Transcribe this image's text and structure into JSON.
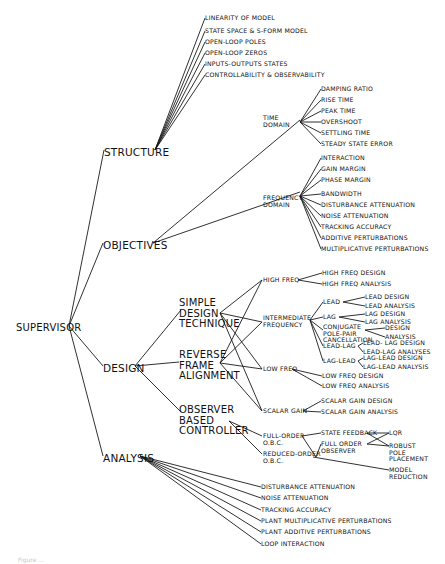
{
  "diagram": {
    "root": {
      "id": "supervisor",
      "label": "SUPERVISOR",
      "x": 16,
      "y": 323,
      "size": "lg"
    },
    "colors": {
      "line": "#1a1a1a",
      "text": "#111111",
      "background": "#ffffff"
    },
    "nodes": [
      {
        "id": "structure",
        "label": "STRUCTURE",
        "x": 104,
        "y": 147,
        "size": "xl"
      },
      {
        "id": "objectives",
        "label": "OBJECTIVES",
        "x": 103,
        "y": 240,
        "size": "xl"
      },
      {
        "id": "design",
        "label": "DESIGN",
        "x": 103,
        "y": 363,
        "size": "xl"
      },
      {
        "id": "analysis",
        "label": "ANALYSIS",
        "x": 103,
        "y": 453,
        "size": "xl"
      },
      {
        "id": "s1",
        "label": "LINEARITY OF MODEL",
        "x": 205,
        "y": 15,
        "size": "sm"
      },
      {
        "id": "s2",
        "label": "STATE SPACE & S-FORM MODEL",
        "x": 205,
        "y": 28,
        "size": "sm"
      },
      {
        "id": "s3",
        "label": "OPEN-LOOP POLES",
        "x": 205,
        "y": 39,
        "size": "sm"
      },
      {
        "id": "s4",
        "label": "OPEN-LOOP ZEROS",
        "x": 205,
        "y": 50,
        "size": "sm"
      },
      {
        "id": "s5",
        "label": "INPUTS-OUTPUTS STATES",
        "x": 205,
        "y": 61,
        "size": "sm"
      },
      {
        "id": "s6",
        "label": "CONTROLLABILITY & OBSERVABILITY",
        "x": 205,
        "y": 72,
        "size": "sm"
      },
      {
        "id": "time",
        "label": "TIME\nDOMAIN",
        "x": 263,
        "y": 115,
        "size": "sm"
      },
      {
        "id": "freq",
        "label": "FREQUENCY\nDOMAIN",
        "x": 263,
        "y": 195,
        "size": "sm"
      },
      {
        "id": "t1",
        "label": "DAMPING RATIO",
        "x": 321,
        "y": 86,
        "size": "sm"
      },
      {
        "id": "t2",
        "label": "RISE TIME",
        "x": 321,
        "y": 97,
        "size": "sm"
      },
      {
        "id": "t3",
        "label": "PEAK TIME",
        "x": 321,
        "y": 108,
        "size": "sm"
      },
      {
        "id": "t4",
        "label": "OVERSHOOT",
        "x": 321,
        "y": 119,
        "size": "sm"
      },
      {
        "id": "t5",
        "label": "SETTLING TIME",
        "x": 321,
        "y": 130,
        "size": "sm"
      },
      {
        "id": "t6",
        "label": "STEADY STATE ERROR",
        "x": 321,
        "y": 141,
        "size": "sm"
      },
      {
        "id": "f1",
        "label": "INTERACTION",
        "x": 321,
        "y": 155,
        "size": "sm"
      },
      {
        "id": "f2",
        "label": "GAIN MARGIN",
        "x": 321,
        "y": 166,
        "size": "sm"
      },
      {
        "id": "f3",
        "label": "PHASE MARGIN",
        "x": 321,
        "y": 177,
        "size": "sm"
      },
      {
        "id": "f4",
        "label": "BANDWIDTH",
        "x": 321,
        "y": 191,
        "size": "sm"
      },
      {
        "id": "f5",
        "label": "DISTURBANCE ATTENUATION",
        "x": 321,
        "y": 202,
        "size": "sm"
      },
      {
        "id": "f6",
        "label": "NOISE ATTENUATION",
        "x": 321,
        "y": 213,
        "size": "sm"
      },
      {
        "id": "f7",
        "label": "TRACKING ACCURACY",
        "x": 321,
        "y": 224,
        "size": "sm"
      },
      {
        "id": "f8",
        "label": "ADDITIVE PERTURBATIONS",
        "x": 321,
        "y": 235,
        "size": "sm"
      },
      {
        "id": "f9",
        "label": "MULTIPLICATIVE PERTURBATIONS",
        "x": 321,
        "y": 246,
        "size": "sm"
      },
      {
        "id": "sdt",
        "label": "SIMPLE\nDESIGN\nTECHNIQUE",
        "x": 179,
        "y": 298,
        "size": "lg"
      },
      {
        "id": "rfa",
        "label": "REVERSE\nFRAME\nALIGNMENT",
        "x": 179,
        "y": 350,
        "size": "lg"
      },
      {
        "id": "obc",
        "label": "OBSERVER\nBASED\nCONTROLLER",
        "x": 179,
        "y": 405,
        "size": "lg"
      },
      {
        "id": "hf",
        "label": "HIGH FREQ",
        "x": 263,
        "y": 277,
        "size": "sm"
      },
      {
        "id": "imf",
        "label": "INTERMEDIATE\nFREQUENCY",
        "x": 263,
        "y": 315,
        "size": "sm"
      },
      {
        "id": "lf",
        "label": "LOW FREQ",
        "x": 263,
        "y": 366,
        "size": "sm"
      },
      {
        "id": "sg",
        "label": "SCALAR GAIN",
        "x": 263,
        "y": 408,
        "size": "sm"
      },
      {
        "id": "fo",
        "label": "FULL-ORDER\nO.B.C.",
        "x": 263,
        "y": 433,
        "size": "sm"
      },
      {
        "id": "ro",
        "label": "REDUCED-ORDER\nO.B.C.",
        "x": 263,
        "y": 451,
        "size": "sm"
      },
      {
        "id": "hfd",
        "label": "HIGH FREQ DESIGN",
        "x": 322,
        "y": 270,
        "size": "sm"
      },
      {
        "id": "hfa",
        "label": "HIGH FREQ ANALYSIS",
        "x": 322,
        "y": 281,
        "size": "sm"
      },
      {
        "id": "lead",
        "label": "LEAD",
        "x": 323,
        "y": 299,
        "size": "sm"
      },
      {
        "id": "lag",
        "label": "LAG",
        "x": 323,
        "y": 314,
        "size": "sm"
      },
      {
        "id": "cpp",
        "label": "CONJUGATE\nPOLE-PAIR\nCANCELLATION",
        "x": 323,
        "y": 324,
        "size": "sm"
      },
      {
        "id": "leadlag",
        "label": "LEAD-LAG",
        "x": 323,
        "y": 343,
        "size": "sm"
      },
      {
        "id": "laglead",
        "label": "LAG-LEAD",
        "x": 323,
        "y": 358,
        "size": "sm"
      },
      {
        "id": "ld",
        "label": "LEAD DESIGN",
        "x": 365,
        "y": 294,
        "size": "sm"
      },
      {
        "id": "la",
        "label": "LEAD ANALYSIS",
        "x": 365,
        "y": 303,
        "size": "sm"
      },
      {
        "id": "lgd",
        "label": "LAG DESIGN",
        "x": 365,
        "y": 311,
        "size": "sm"
      },
      {
        "id": "lga",
        "label": "LAG ANALYSIS",
        "x": 365,
        "y": 319,
        "size": "sm"
      },
      {
        "id": "cpd",
        "label": "DESIGN",
        "x": 385,
        "y": 325,
        "size": "sm"
      },
      {
        "id": "cpa",
        "label": "ANALYSIS",
        "x": 385,
        "y": 334,
        "size": "sm"
      },
      {
        "id": "lld",
        "label": "LEAD- LAG DESIGN",
        "x": 363,
        "y": 340,
        "size": "sm"
      },
      {
        "id": "lla",
        "label": "LEAD-LAG ANALYSES",
        "x": 363,
        "y": 349,
        "size": "sm"
      },
      {
        "id": "gld",
        "label": "LAG-LEAD DESIGN",
        "x": 363,
        "y": 355,
        "size": "sm"
      },
      {
        "id": "gla",
        "label": "LAG-LEAD ANALYSIS",
        "x": 363,
        "y": 364,
        "size": "sm"
      },
      {
        "id": "lfd",
        "label": "LOW FREQ DESIGN",
        "x": 322,
        "y": 373,
        "size": "sm"
      },
      {
        "id": "lfa",
        "label": "LOW FREQ ANALYSIS",
        "x": 322,
        "y": 383,
        "size": "sm"
      },
      {
        "id": "sgd",
        "label": "SCALAR GAIN DESIGN",
        "x": 321,
        "y": 398,
        "size": "sm"
      },
      {
        "id": "sga",
        "label": "SCALAR GAIN ANALYSIS",
        "x": 321,
        "y": 409,
        "size": "sm"
      },
      {
        "id": "sf",
        "label": "STATE FEEDBACK",
        "x": 321,
        "y": 430,
        "size": "sm"
      },
      {
        "id": "foo",
        "label": "FULL ORDER\nOBSERVER",
        "x": 321,
        "y": 441,
        "size": "sm"
      },
      {
        "id": "lqr",
        "label": "LQR",
        "x": 389,
        "y": 430,
        "size": "sm"
      },
      {
        "id": "rpp",
        "label": "ROBUST\nPOLE\nPLACEMENT",
        "x": 389,
        "y": 443,
        "size": "sm"
      },
      {
        "id": "mr",
        "label": "MODEL\nREDUCTION",
        "x": 389,
        "y": 467,
        "size": "sm"
      },
      {
        "id": "a1",
        "label": "DISTURBANCE ATTENUATION",
        "x": 261,
        "y": 484,
        "size": "sm"
      },
      {
        "id": "a2",
        "label": "NOISE ATTENUATION",
        "x": 261,
        "y": 495,
        "size": "sm"
      },
      {
        "id": "a3",
        "label": "TRACKING ACCURACY",
        "x": 261,
        "y": 507,
        "size": "sm"
      },
      {
        "id": "a4",
        "label": "PLANT MULTIPLICATIVE PERTURBATIONS",
        "x": 261,
        "y": 518,
        "size": "sm"
      },
      {
        "id": "a5",
        "label": "PLANT ADDITIVE PERTURBATIONS",
        "x": 261,
        "y": 529,
        "size": "sm"
      },
      {
        "id": "a6",
        "label": "LOOP INTERACTION",
        "x": 261,
        "y": 541,
        "size": "sm"
      }
    ],
    "edges": [
      [
        69,
        326,
        104,
        150
      ],
      [
        69,
        326,
        103,
        243
      ],
      [
        69,
        326,
        103,
        366
      ],
      [
        69,
        326,
        103,
        456
      ],
      [
        155,
        150,
        205,
        18
      ],
      [
        155,
        150,
        205,
        31
      ],
      [
        155,
        150,
        205,
        42
      ],
      [
        155,
        150,
        205,
        53
      ],
      [
        155,
        150,
        205,
        64
      ],
      [
        155,
        150,
        205,
        75
      ],
      [
        153,
        243,
        300,
        120
      ],
      [
        153,
        243,
        300,
        192
      ],
      [
        300,
        122,
        321,
        89
      ],
      [
        300,
        122,
        321,
        100
      ],
      [
        300,
        122,
        321,
        111
      ],
      [
        300,
        122,
        321,
        122
      ],
      [
        300,
        122,
        321,
        133
      ],
      [
        300,
        122,
        321,
        144
      ],
      [
        300,
        196,
        321,
        158
      ],
      [
        300,
        196,
        321,
        169
      ],
      [
        300,
        196,
        321,
        180
      ],
      [
        300,
        196,
        321,
        194
      ],
      [
        300,
        196,
        321,
        205
      ],
      [
        300,
        196,
        321,
        216
      ],
      [
        300,
        196,
        321,
        227
      ],
      [
        300,
        196,
        321,
        238
      ],
      [
        300,
        196,
        321,
        249
      ],
      [
        135,
        366,
        181,
        310
      ],
      [
        135,
        366,
        179,
        362
      ],
      [
        135,
        366,
        181,
        412
      ],
      [
        220,
        313,
        262,
        280
      ],
      [
        220,
        313,
        262,
        322
      ],
      [
        220,
        313,
        262,
        369
      ],
      [
        220,
        313,
        262,
        411
      ],
      [
        220,
        363,
        262,
        280
      ],
      [
        220,
        363,
        262,
        322
      ],
      [
        220,
        363,
        262,
        369
      ],
      [
        220,
        363,
        262,
        411
      ],
      [
        229,
        421,
        262,
        436
      ],
      [
        229,
        421,
        262,
        454
      ],
      [
        298,
        280,
        322,
        273
      ],
      [
        298,
        280,
        322,
        284
      ],
      [
        310,
        320,
        323,
        302
      ],
      [
        310,
        320,
        323,
        317
      ],
      [
        310,
        320,
        323,
        330
      ],
      [
        310,
        320,
        323,
        346
      ],
      [
        310,
        320,
        323,
        361
      ],
      [
        343,
        302,
        365,
        297
      ],
      [
        343,
        302,
        365,
        306
      ],
      [
        339,
        317,
        365,
        314
      ],
      [
        339,
        317,
        365,
        322
      ],
      [
        365,
        330,
        385,
        328
      ],
      [
        365,
        330,
        385,
        337
      ],
      [
        358,
        346,
        363,
        343
      ],
      [
        358,
        346,
        363,
        352
      ],
      [
        358,
        361,
        363,
        358
      ],
      [
        358,
        361,
        363,
        367
      ],
      [
        292,
        369,
        322,
        376
      ],
      [
        292,
        369,
        322,
        386
      ],
      [
        303,
        411,
        321,
        401
      ],
      [
        303,
        411,
        321,
        412
      ],
      [
        302,
        436,
        321,
        433
      ],
      [
        302,
        436,
        316,
        457
      ],
      [
        316,
        457,
        321,
        444
      ],
      [
        313,
        457,
        389,
        470
      ],
      [
        367,
        433,
        389,
        433
      ],
      [
        367,
        433,
        389,
        446
      ],
      [
        367,
        444,
        389,
        433
      ],
      [
        367,
        444,
        389,
        446
      ],
      [
        140,
        456,
        261,
        487
      ],
      [
        140,
        456,
        261,
        498
      ],
      [
        140,
        456,
        261,
        510
      ],
      [
        140,
        456,
        261,
        521
      ],
      [
        140,
        456,
        261,
        532
      ],
      [
        140,
        456,
        261,
        544
      ]
    ]
  },
  "caption": {
    "text": "Figure ..."
  }
}
